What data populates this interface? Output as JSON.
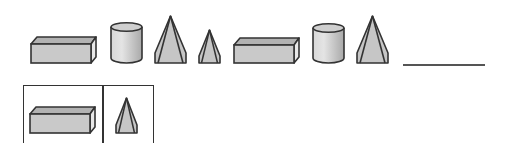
{
  "puzzle": {
    "sequence": [
      {
        "shape": "rectangular-prism",
        "x": 30,
        "y": 36,
        "w": 67,
        "h": 28
      },
      {
        "shape": "cylinder",
        "x": 110,
        "y": 22,
        "w": 33,
        "h": 42
      },
      {
        "shape": "pyramid-large",
        "x": 154,
        "y": 15,
        "w": 33,
        "h": 49
      },
      {
        "shape": "pyramid-small",
        "x": 198,
        "y": 29,
        "w": 23,
        "h": 35
      },
      {
        "shape": "rectangular-prism",
        "x": 233,
        "y": 37,
        "w": 67,
        "h": 27
      },
      {
        "shape": "cylinder",
        "x": 312,
        "y": 23,
        "w": 33,
        "h": 41
      },
      {
        "shape": "pyramid-large",
        "x": 356,
        "y": 15,
        "w": 33,
        "h": 49
      }
    ],
    "answer_blank": {
      "x": 403,
      "y": 64,
      "w": 82
    },
    "answer_options": [
      {
        "shape": "rectangular-prism"
      },
      {
        "shape": "pyramid-small"
      }
    ]
  },
  "colors": {
    "fill_face": "#c8c8c8",
    "fill_top": "#b4b4b4",
    "fill_side": "#e6e6e6",
    "stroke": "#333333",
    "line": "#555555"
  }
}
